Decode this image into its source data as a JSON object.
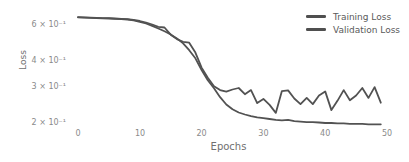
{
  "chart_data": {
    "type": "line",
    "title": "",
    "xlabel": "Epochs",
    "ylabel": "Loss",
    "x_scale": "linear",
    "y_scale": "log",
    "xlim": [
      0,
      50
    ],
    "ylim": [
      0.19,
      0.68
    ],
    "grid": false,
    "legend_position": "upper right",
    "x_ticks": [
      0,
      10,
      20,
      30,
      40,
      50
    ],
    "y_tick_values": [
      0.6,
      0.4,
      0.3,
      0.2
    ],
    "y_tick_labels": [
      "6 × 10⁻¹",
      "4 × 10⁻¹",
      "3 × 10⁻¹",
      "2 × 10⁻¹"
    ],
    "line_color": "#525252",
    "x": [
      0,
      1,
      2,
      3,
      4,
      5,
      6,
      7,
      8,
      9,
      10,
      11,
      12,
      13,
      14,
      15,
      16,
      17,
      18,
      19,
      20,
      21,
      22,
      23,
      24,
      25,
      26,
      27,
      28,
      29,
      30,
      31,
      32,
      33,
      34,
      35,
      36,
      37,
      38,
      39,
      40,
      41,
      42,
      43,
      44,
      45,
      46,
      47,
      48,
      49
    ],
    "series": [
      {
        "name": "Training Loss",
        "color": "#525252",
        "values": [
          0.653,
          0.652,
          0.65,
          0.648,
          0.646,
          0.645,
          0.643,
          0.641,
          0.638,
          0.632,
          0.622,
          0.61,
          0.594,
          0.577,
          0.559,
          0.54,
          0.516,
          0.488,
          0.452,
          0.413,
          0.362,
          0.323,
          0.295,
          0.267,
          0.246,
          0.233,
          0.225,
          0.22,
          0.216,
          0.213,
          0.211,
          0.209,
          0.207,
          0.206,
          0.207,
          0.204,
          0.203,
          0.202,
          0.202,
          0.201,
          0.2,
          0.2,
          0.199,
          0.199,
          0.198,
          0.198,
          0.198,
          0.197,
          0.197,
          0.197
        ]
      },
      {
        "name": "Validation Loss",
        "color": "#525252",
        "values": [
          0.655,
          0.654,
          0.652,
          0.65,
          0.648,
          0.647,
          0.645,
          0.643,
          0.64,
          0.635,
          0.627,
          0.617,
          0.603,
          0.588,
          0.583,
          0.538,
          0.512,
          0.497,
          0.492,
          0.44,
          0.372,
          0.332,
          0.302,
          0.289,
          0.284,
          0.291,
          0.296,
          0.276,
          0.289,
          0.25,
          0.262,
          0.245,
          0.224,
          0.286,
          0.288,
          0.263,
          0.247,
          0.265,
          0.247,
          0.272,
          0.285,
          0.231,
          0.257,
          0.289,
          0.258,
          0.272,
          0.296,
          0.265,
          0.299,
          0.251
        ]
      }
    ]
  }
}
